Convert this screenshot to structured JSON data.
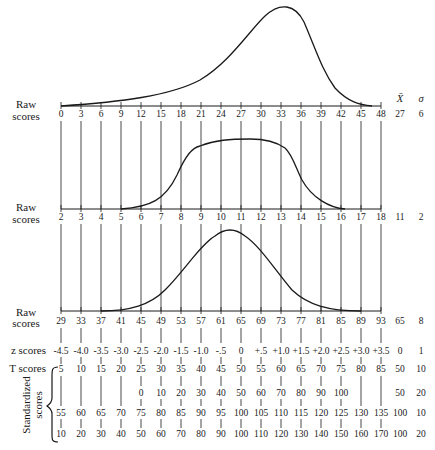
{
  "chart_data": {
    "type": "line",
    "title": "",
    "header": {
      "mean_symbol": "X̄",
      "sd_symbol": "σ"
    },
    "distributions": [
      {
        "name": "Raw scores (negatively skewed)",
        "label": [
          "Raw",
          "scores"
        ],
        "ticks": [
          0,
          3,
          6,
          9,
          12,
          15,
          18,
          21,
          24,
          27,
          30,
          33,
          36,
          39,
          42,
          45,
          48
        ],
        "mean": "27",
        "sd": "6",
        "shape": "negatively skewed, peak near 30"
      },
      {
        "name": "Raw scores (platykurtic)",
        "label": [
          "Raw",
          "scores"
        ],
        "ticks": [
          2,
          3,
          4,
          5,
          6,
          7,
          8,
          9,
          10,
          11,
          12,
          13,
          14,
          15,
          16,
          17,
          18
        ],
        "mean": "11",
        "sd": "2",
        "shape": "flat-topped, plateau from 9 to 13"
      },
      {
        "name": "Raw scores (normal)",
        "label": [
          "Raw",
          "scores"
        ],
        "ticks": [
          29,
          33,
          37,
          41,
          45,
          49,
          53,
          57,
          61,
          65,
          69,
          73,
          77,
          81,
          85,
          89,
          93
        ],
        "mean": "65",
        "sd": "8",
        "shape": "normal, peak at 65"
      }
    ],
    "z_scores": {
      "label": "z scores",
      "values": [
        "-4.5",
        "-4.0",
        "-3.5",
        "-3.0",
        "-2.5",
        "-2.0",
        "-1.5",
        "-1.0",
        "-.5",
        "0",
        "+.5",
        "+1.0",
        "+1.5",
        "+2.0",
        "+2.5",
        "+3.0",
        "+3.5"
      ],
      "mean": "0",
      "sd": "1"
    },
    "t_scores": {
      "label": "T scores",
      "values": [
        "5",
        "10",
        "15",
        "20",
        "25",
        "30",
        "35",
        "40",
        "45",
        "50",
        "55",
        "60",
        "65",
        "70",
        "75",
        "80",
        "85"
      ],
      "mean": "50",
      "sd": "10"
    },
    "standardized_label": [
      "Standardized",
      "scores"
    ],
    "standardized_scores": [
      {
        "values": [
          "",
          "",
          "",
          "",
          "0",
          "10",
          "20",
          "30",
          "40",
          "50",
          "60",
          "70",
          "80",
          "90",
          "100",
          "",
          ""
        ],
        "mean": "50",
        "sd": "20"
      },
      {
        "values": [
          "55",
          "60",
          "65",
          "70",
          "75",
          "80",
          "85",
          "90",
          "95",
          "100",
          "105",
          "110",
          "115",
          "120",
          "125",
          "130",
          "135"
        ],
        "mean": "100",
        "sd": "10"
      },
      {
        "values": [
          "10",
          "20",
          "30",
          "40",
          "50",
          "60",
          "70",
          "80",
          "90",
          "100",
          "110",
          "120",
          "130",
          "140",
          "150",
          "160",
          "170"
        ],
        "mean": "100",
        "sd": "20"
      }
    ]
  }
}
